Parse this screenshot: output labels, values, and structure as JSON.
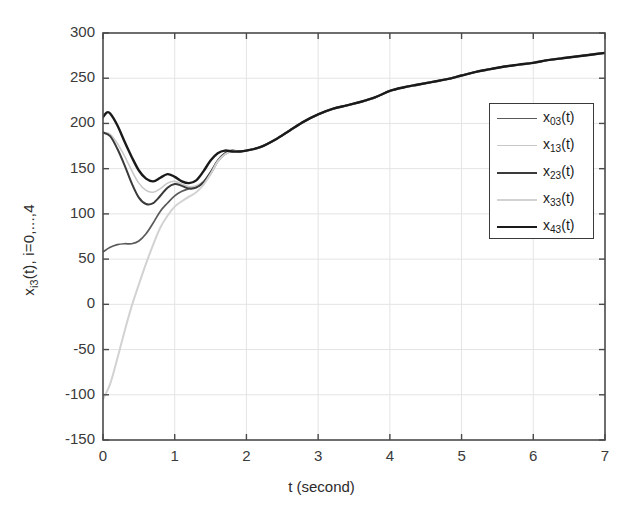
{
  "chart_data": {
    "type": "line",
    "title": "",
    "xlabel": "t (second)",
    "ylabel": "x_i3(t),  i=0,...,4",
    "ylabel_parts": {
      "base": "x",
      "sub": "i3",
      "rest": "(t),  i=0,...,4"
    },
    "xlim": [
      0,
      7
    ],
    "ylim": [
      -150,
      300
    ],
    "xticks": [
      0,
      1,
      2,
      3,
      4,
      5,
      6,
      7
    ],
    "yticks": [
      -150,
      -100,
      -50,
      0,
      50,
      100,
      150,
      200,
      250,
      300
    ],
    "xtick_labels": [
      "0",
      "1",
      "2",
      "3",
      "4",
      "5",
      "6",
      "7"
    ],
    "ytick_labels": [
      "-150",
      "-100",
      "-50",
      "0",
      "50",
      "100",
      "150",
      "200",
      "250",
      "300"
    ],
    "grid": true,
    "legend_position": "upper right",
    "series": [
      {
        "name": "x03(t)",
        "label_base": "x",
        "label_sub": "03",
        "label_rest": "(t)",
        "color": "#5a5a5a",
        "width": 1.7,
        "x": [
          0,
          0.1,
          0.2,
          0.3,
          0.4,
          0.5,
          0.6,
          0.7,
          0.8,
          0.9,
          1.0,
          1.1,
          1.2,
          1.3,
          1.4,
          1.5,
          1.6,
          1.7,
          1.8,
          1.9,
          2.0,
          2.2,
          2.4,
          2.6,
          2.8,
          3.0,
          3.2,
          3.4,
          3.6,
          3.8,
          4.0,
          4.2,
          4.4,
          4.6,
          4.8,
          5.0,
          5.2,
          5.4,
          5.6,
          5.8,
          6.0,
          6.2,
          6.4,
          6.6,
          6.8,
          7.0
        ],
        "y": [
          58,
          63,
          66,
          67,
          67,
          70,
          78,
          90,
          103,
          112,
          120,
          125,
          128,
          130,
          134,
          144,
          158,
          166,
          169,
          169,
          170,
          174,
          182,
          192,
          202,
          210,
          216,
          220,
          224,
          229,
          236,
          240,
          243,
          246,
          249,
          253,
          257,
          260,
          263,
          265,
          267,
          270,
          272,
          274,
          276,
          278
        ]
      },
      {
        "name": "x13(t)",
        "label_base": "x",
        "label_sub": "13",
        "label_rest": "(t)",
        "color": "#c8c8c8",
        "width": 1.6,
        "x": [
          0,
          0.1,
          0.2,
          0.3,
          0.4,
          0.5,
          0.6,
          0.7,
          0.8,
          0.9,
          1.0,
          1.1,
          1.2,
          1.3,
          1.4,
          1.5,
          1.6,
          1.7,
          1.8,
          1.9,
          2.0,
          2.2,
          2.4,
          2.6,
          2.8,
          3.0,
          3.2,
          3.4,
          3.6,
          3.8,
          4.0,
          4.2,
          4.4,
          4.6,
          4.8,
          5.0,
          5.2,
          5.4,
          5.6,
          5.8,
          6.0,
          6.2,
          6.4,
          6.6,
          6.8,
          7.0
        ],
        "y": [
          190,
          188,
          178,
          164,
          148,
          134,
          126,
          124,
          128,
          134,
          136,
          133,
          130,
          131,
          136,
          146,
          159,
          167,
          170,
          169,
          170,
          174,
          182,
          192,
          202,
          210,
          216,
          220,
          224,
          229,
          236,
          240,
          243,
          246,
          249,
          253,
          257,
          260,
          263,
          265,
          267,
          270,
          272,
          274,
          276,
          278
        ]
      },
      {
        "name": "x23(t)",
        "label_base": "x",
        "label_sub": "23",
        "label_rest": "(t)",
        "color": "#3a3a3a",
        "width": 2.0,
        "x": [
          0,
          0.1,
          0.2,
          0.3,
          0.4,
          0.5,
          0.6,
          0.7,
          0.8,
          0.9,
          1.0,
          1.1,
          1.2,
          1.3,
          1.4,
          1.5,
          1.6,
          1.7,
          1.8,
          1.9,
          2.0,
          2.2,
          2.4,
          2.6,
          2.8,
          3.0,
          3.2,
          3.4,
          3.6,
          3.8,
          4.0,
          4.2,
          4.4,
          4.6,
          4.8,
          5.0,
          5.2,
          5.4,
          5.6,
          5.8,
          6.0,
          6.2,
          6.4,
          6.6,
          6.8,
          7.0
        ],
        "y": [
          190,
          186,
          172,
          154,
          134,
          118,
          111,
          112,
          120,
          129,
          133,
          131,
          128,
          129,
          135,
          146,
          159,
          167,
          170,
          169,
          170,
          174,
          182,
          192,
          202,
          210,
          216,
          220,
          224,
          229,
          236,
          240,
          243,
          246,
          249,
          253,
          257,
          260,
          263,
          265,
          267,
          270,
          272,
          274,
          276,
          278
        ]
      },
      {
        "name": "x33(t)",
        "label_base": "x",
        "label_sub": "33",
        "label_rest": "(t)",
        "color": "#d2d2d2",
        "width": 2.0,
        "x": [
          0,
          0.1,
          0.2,
          0.3,
          0.4,
          0.5,
          0.6,
          0.7,
          0.8,
          0.9,
          1.0,
          1.1,
          1.2,
          1.3,
          1.4,
          1.5,
          1.6,
          1.7,
          1.8,
          1.9,
          2.0,
          2.2,
          2.4,
          2.6,
          2.8,
          3.0,
          3.2,
          3.4,
          3.6,
          3.8,
          4.0,
          4.2,
          4.4,
          4.6,
          4.8,
          5.0,
          5.2,
          5.4,
          5.6,
          5.8,
          6.0,
          6.2,
          6.4,
          6.6,
          6.8,
          7.0
        ],
        "y": [
          -105,
          -88,
          -60,
          -30,
          -2,
          22,
          45,
          66,
          85,
          98,
          108,
          114,
          119,
          124,
          132,
          144,
          158,
          166,
          169,
          169,
          170,
          174,
          182,
          192,
          202,
          210,
          216,
          220,
          224,
          229,
          236,
          240,
          243,
          246,
          249,
          253,
          257,
          260,
          263,
          265,
          267,
          270,
          272,
          274,
          276,
          278
        ]
      },
      {
        "name": "x43(t)",
        "label_base": "x",
        "label_sub": "43",
        "label_rest": "(t)",
        "color": "#1a1a1a",
        "width": 2.4,
        "x": [
          0,
          0.05,
          0.1,
          0.2,
          0.3,
          0.4,
          0.5,
          0.6,
          0.7,
          0.8,
          0.9,
          1.0,
          1.1,
          1.2,
          1.3,
          1.4,
          1.5,
          1.6,
          1.7,
          1.8,
          1.9,
          2.0,
          2.2,
          2.4,
          2.6,
          2.8,
          3.0,
          3.2,
          3.4,
          3.6,
          3.8,
          4.0,
          4.2,
          4.4,
          4.6,
          4.8,
          5.0,
          5.2,
          5.4,
          5.6,
          5.8,
          6.0,
          6.2,
          6.4,
          6.6,
          6.8,
          7.0
        ],
        "y": [
          207,
          212,
          211,
          198,
          180,
          163,
          148,
          139,
          136,
          140,
          144,
          141,
          136,
          134,
          137,
          147,
          159,
          167,
          170,
          169,
          169,
          170,
          174,
          182,
          192,
          202,
          210,
          216,
          220,
          224,
          229,
          236,
          240,
          243,
          246,
          249,
          253,
          257,
          260,
          263,
          265,
          267,
          270,
          272,
          274,
          276,
          278
        ]
      }
    ]
  }
}
